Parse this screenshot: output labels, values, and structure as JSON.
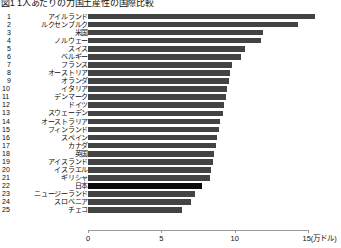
{
  "chart_data": {
    "type": "bar",
    "orientation": "horizontal",
    "title": "図1 1人あたりの力国土産性の国際比較",
    "xlabel": "",
    "ylabel": "",
    "unit_label": "(万ドル)",
    "xlim": [
      0,
      15
    ],
    "xticks": [
      0,
      5,
      10,
      15
    ],
    "xticklabels": [
      "0",
      "5",
      "10",
      "15"
    ],
    "grid": false,
    "legend": false,
    "highlight_category": "日本",
    "colors": {
      "bar": "#434343",
      "highlight": "#0a0a0a",
      "axis": "#9a9a9a"
    },
    "categories": [
      "アイルランド",
      "ルクセンブルク",
      "米国",
      "ノルウェー",
      "スイス",
      "ベルギー",
      "フランス",
      "オーストリア",
      "オランダ",
      "イタリア",
      "デンマーク",
      "ドイツ",
      "スウェーデン",
      "オーストラリア",
      "フィンランド",
      "スペイン",
      "カナダ",
      "英国",
      "アイスランド",
      "イスラエル",
      "ギリシャ",
      "日本",
      "ニュージーランド",
      "スロベニア",
      "チェコ"
    ],
    "ranks": [
      1,
      2,
      3,
      4,
      5,
      6,
      7,
      8,
      9,
      10,
      11,
      12,
      13,
      14,
      15,
      16,
      17,
      18,
      19,
      20,
      21,
      22,
      23,
      24,
      25
    ],
    "values": [
      15.5,
      14.3,
      11.9,
      11.8,
      10.7,
      10.4,
      9.8,
      9.7,
      9.6,
      9.5,
      9.4,
      9.3,
      9.2,
      9.0,
      8.9,
      8.8,
      8.7,
      8.6,
      8.5,
      8.4,
      8.3,
      7.8,
      7.3,
      7.0,
      6.4
    ]
  }
}
